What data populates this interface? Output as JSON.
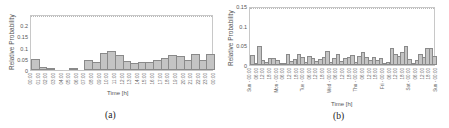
{
  "chart_data": [
    {
      "type": "bar",
      "caption": "(a)",
      "title": "",
      "xlabel": "Time [h]",
      "ylabel": "Relative Probability",
      "ylim": [
        0,
        0.25
      ],
      "yticks": [
        "0",
        "0.05",
        "0.1",
        "0.15",
        "0.2"
      ],
      "grid": false,
      "categories": [
        "00:00",
        "01:00",
        "02:00",
        "03:00",
        "04:00",
        "05:00",
        "06:00",
        "07:00",
        "08:00",
        "09:00",
        "10:00",
        "11:00",
        "12:00",
        "13:00",
        "14:00",
        "15:00",
        "16:00",
        "17:00",
        "18:00",
        "19:00",
        "20:00",
        "21:00",
        "22:00",
        "23:00",
        "00:00"
      ],
      "values": [
        0.052,
        0.015,
        0.007,
        0.002,
        0.0,
        0.005,
        0.002,
        0.047,
        0.038,
        0.078,
        0.087,
        0.07,
        0.04,
        0.032,
        0.035,
        0.038,
        0.048,
        0.056,
        0.07,
        0.065,
        0.048,
        0.072,
        0.047,
        0.072
      ]
    },
    {
      "type": "bar",
      "caption": "(b)",
      "title": "",
      "xlabel": "Time [h]",
      "ylabel": "Relative Probability",
      "ylim": [
        0,
        0.15
      ],
      "yticks": [
        "0",
        "0.05",
        "0.1",
        "0.15"
      ],
      "grid": false,
      "categories": [
        "Sun - 00:00",
        "06:00",
        "12:00",
        "18:00",
        "Mon - 00:00",
        "06:00",
        "12:00",
        "18:00",
        "Tue - 00:00",
        "06:00",
        "12:00",
        "18:00",
        "Wed - 00:00",
        "06:00",
        "12:00",
        "18:00",
        "Thu - 00:00",
        "06:00",
        "12:00",
        "18:00",
        "Fri - 00:00",
        "06:00",
        "12:00",
        "18:00",
        "Sat - 00:00",
        "06:00",
        "12:00",
        "18:00",
        "Sun - 00:00"
      ],
      "values": [
        0.026,
        0.003,
        0.049,
        0.014,
        0.007,
        0.018,
        0.018,
        0.013,
        0.003,
        0.006,
        0.03,
        0.011,
        0.017,
        0.028,
        0.02,
        0.009,
        0.023,
        0.018,
        0.01,
        0.017,
        0.021,
        0.036,
        0.008,
        0.019,
        0.029,
        0.01,
        0.018,
        0.022,
        0.027,
        0.008,
        0.023,
        0.035,
        0.02,
        0.014,
        0.02,
        0.014,
        0.018,
        0.004,
        0.008,
        0.046,
        0.03,
        0.024,
        0.034,
        0.05,
        0.016,
        0.004,
        0.014,
        0.03,
        0.02,
        0.046,
        0.045,
        0.024
      ]
    }
  ]
}
